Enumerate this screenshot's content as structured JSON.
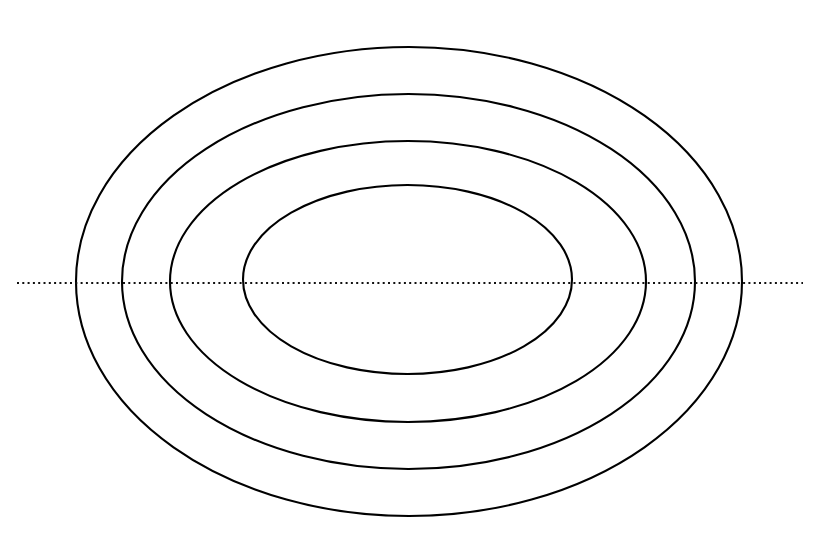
{
  "figure": {
    "background_color": "#ffffff",
    "width": 829,
    "height": 548
  },
  "chart_data": {
    "type": "scatter",
    "subtitle": "",
    "xlabel": "",
    "ylabel": "",
    "xlim": [
      0,
      829
    ],
    "ylim": [
      0,
      548
    ],
    "grid": false,
    "legend": null,
    "annotations": [],
    "tick_labels": {
      "x": [],
      "y": []
    },
    "stroke_color": "#000000",
    "stroke_width": 2.1,
    "center": {
      "x": 408,
      "y": 281
    },
    "series": [
      {
        "name": "ellipse-1-outer",
        "type": "ellipse",
        "cx": 409,
        "cy": 281.5,
        "rx": 333,
        "ry": 234.5,
        "left_x": 76,
        "right_x": 742,
        "top_y": 47,
        "bottom_y": 516
      },
      {
        "name": "ellipse-2",
        "type": "ellipse",
        "cx": 408.5,
        "cy": 281.5,
        "rx": 286.5,
        "ry": 187.5,
        "left_x": 122,
        "right_x": 695,
        "top_y": 94,
        "bottom_y": 469
      },
      {
        "name": "ellipse-3",
        "type": "ellipse",
        "cx": 408,
        "cy": 281.5,
        "rx": 238,
        "ry": 140.5,
        "left_x": 170,
        "right_x": 646,
        "top_y": 141,
        "bottom_y": 422
      },
      {
        "name": "ellipse-4-inner",
        "type": "ellipse",
        "cx": 407.5,
        "cy": 279.5,
        "rx": 164.5,
        "ry": 94.5,
        "left_x": 243,
        "right_x": 572,
        "top_y": 185,
        "bottom_y": 374
      }
    ],
    "axis": {
      "name": "major-axis-dotted-line",
      "orientation": "horizontal",
      "y": 283,
      "x_start": 17,
      "x_end": 803,
      "style": "dotted",
      "color": "#111111",
      "dash_pattern": "2 3.3"
    }
  }
}
